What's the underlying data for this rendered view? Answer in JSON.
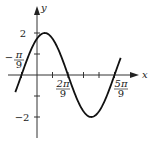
{
  "chart_data": {
    "type": "line",
    "title": "",
    "function": "y = 2 sin(3x + π/3)",
    "xlabel": "x",
    "ylabel": "y",
    "x_tick_labels": [
      "−π/9",
      "2π/9",
      "5π/9"
    ],
    "y_tick_labels": [
      "2",
      "−2"
    ],
    "x_ticks_units_pi_over_9": [
      -1,
      1,
      2,
      3,
      4,
      5
    ],
    "y_ticks": [
      -2,
      -1,
      1,
      2
    ],
    "xlim_pi_over_9": [
      -1.5,
      5.5
    ],
    "ylim": [
      -2.8,
      3.2
    ],
    "grid": false,
    "series": [
      {
        "name": "curve",
        "x_pi_over_9": [
          -1,
          0.5,
          2,
          3.5,
          5
        ],
        "y": [
          0,
          2,
          0,
          -2,
          0
        ]
      }
    ],
    "zeros": [
      "−π/9",
      "2π/9",
      "5π/9"
    ],
    "max": {
      "x": "π/18",
      "y": 2
    },
    "min": {
      "x": "7π/18",
      "y": -2
    }
  },
  "labels": {
    "x_axis": "x",
    "y_axis": "y",
    "y_pos": "2",
    "y_neg": "−2",
    "neg_pi_9_num": "π",
    "neg_pi_9_den": "9",
    "two_pi_9_num": "2π",
    "two_pi_9_den": "9",
    "five_pi_9_num": "5π",
    "five_pi_9_den": "9"
  }
}
